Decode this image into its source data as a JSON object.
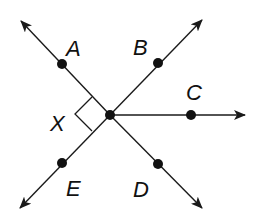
{
  "diagram": {
    "stroke_color": "#1a1a1a",
    "background": "#ffffff",
    "vertex": {
      "x": 110,
      "y": 115
    },
    "rays": [
      {
        "name": "A",
        "point": {
          "x": 62,
          "y": 64
        },
        "tip": {
          "x": 21,
          "y": 21
        },
        "label": "A",
        "label_pos": {
          "x": 66,
          "y": 56
        }
      },
      {
        "name": "B",
        "point": {
          "x": 158,
          "y": 63
        },
        "tip": {
          "x": 202,
          "y": 20
        },
        "label": "B",
        "label_pos": {
          "x": 133,
          "y": 55
        }
      },
      {
        "name": "C",
        "point": {
          "x": 191,
          "y": 115
        },
        "tip": {
          "x": 245,
          "y": 115
        },
        "label": "C",
        "label_pos": {
          "x": 186,
          "y": 100
        }
      },
      {
        "name": "D",
        "point": {
          "x": 158,
          "y": 164
        },
        "tip": {
          "x": 202,
          "y": 208
        },
        "label": "D",
        "label_pos": {
          "x": 133,
          "y": 197
        }
      },
      {
        "name": "E",
        "point": {
          "x": 62,
          "y": 163
        },
        "tip": {
          "x": 20,
          "y": 208
        },
        "label": "E",
        "label_pos": {
          "x": 66,
          "y": 196
        }
      }
    ],
    "angle_label": {
      "text": "X",
      "x": 50,
      "y": 131
    },
    "right_angle_marker": {
      "p1": {
        "x": 92,
        "y": 97
      },
      "corner": {
        "x": 75,
        "y": 114
      },
      "p2": {
        "x": 92,
        "y": 131
      }
    }
  }
}
